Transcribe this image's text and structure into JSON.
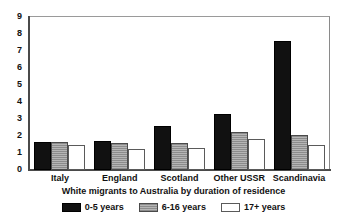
{
  "chart_data": {
    "type": "bar",
    "title": "",
    "subtitle": "White migrants to Australia by duration of residence",
    "xlabel": "",
    "ylabel": "",
    "categories": [
      "Italy",
      "England",
      "Scotland",
      "Other USSR",
      "Scandinavia"
    ],
    "series": [
      {
        "name": "0-5 years",
        "values": [
          1.65,
          1.7,
          2.6,
          3.3,
          7.6
        ],
        "color": "#111111",
        "pattern": "solid-black"
      },
      {
        "name": "6-16 years",
        "values": [
          1.65,
          1.6,
          1.6,
          2.25,
          2.05
        ],
        "color": "#9a9a9a",
        "pattern": "horizontal-hatch-gray"
      },
      {
        "name": "17+ years",
        "values": [
          1.5,
          1.25,
          1.3,
          1.8,
          1.5
        ],
        "color": "#ffffff",
        "pattern": "open-white"
      }
    ],
    "ylim": [
      0,
      9
    ],
    "yticks": [
      0,
      1,
      2,
      3,
      4,
      5,
      6,
      7,
      8,
      9
    ],
    "ytick_labels": [
      "0",
      "1",
      "2",
      "3",
      "4",
      "5",
      "6",
      "7",
      "8",
      "9"
    ],
    "grid": false,
    "legend_position": "bottom",
    "frame": true
  }
}
